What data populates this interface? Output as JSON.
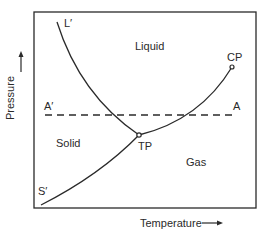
{
  "diagram": {
    "type": "phase-diagram",
    "axes": {
      "x_label": "Temperature",
      "y_label": "Pressure"
    },
    "regions": {
      "liquid": "Liquid",
      "solid": "Solid",
      "gas": "Gas"
    },
    "points": {
      "triple_point": "TP",
      "critical_point": "CP"
    },
    "curve_labels": {
      "melting_curve_end": "L′",
      "sublimation_curve_end": "S′"
    },
    "isobar": {
      "left_label": "A′",
      "right_label": "A"
    },
    "colors": {
      "line": "#2a2a2a",
      "background": "#ffffff"
    }
  }
}
